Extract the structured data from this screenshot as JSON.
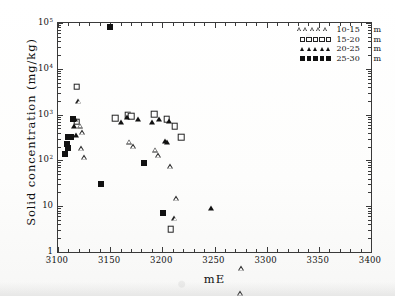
{
  "chart_data": {
    "type": "scatter",
    "title": "",
    "xlabel": "mE",
    "ylabel": "Solid concentration (mg/kg)",
    "xlim": [
      3100,
      3400
    ],
    "ylim": [
      1,
      100000
    ],
    "yscale": "log",
    "xscale": "linear",
    "grid": false,
    "legend_position": "top-right",
    "xticks": [
      3100,
      3150,
      3200,
      3250,
      3300,
      3350,
      3400
    ],
    "xticklabels": [
      "3100",
      "3150",
      "3200",
      "3250",
      "3300",
      "3350",
      "3400"
    ],
    "yticks": [
      1,
      10,
      100,
      1000,
      10000,
      100000
    ],
    "yticklabels": [
      "1",
      "10",
      "10<sup>2</sup>",
      "10<sup>3</sup>",
      "10<sup>4</sup>",
      "10<sup>5</sup>"
    ],
    "ytick_plain": [
      "1",
      "10",
      "100",
      "1000",
      "10000",
      "100000"
    ],
    "minor_ticks": true,
    "series": [
      {
        "name": "10-15",
        "label": "10-15",
        "unit": "m",
        "marker": "triangle-open",
        "color": "#222222",
        "points": [
          [
            3120,
            1950
          ],
          [
            3121,
            740
          ],
          [
            3123,
            690
          ],
          [
            3122,
            390
          ],
          [
            3125,
            320
          ],
          [
            3168,
            900
          ],
          [
            3172,
            920
          ],
          [
            3193,
            1000
          ],
          [
            3196,
            960
          ],
          [
            3208,
            730
          ],
          [
            3213,
            185
          ],
          [
            3212,
            88
          ],
          [
            3276,
            9.2
          ],
          [
            3275,
            3.3
          ]
        ]
      },
      {
        "name": "15-20",
        "label": "15-20",
        "unit": "m",
        "marker": "square-open",
        "color": "#222222",
        "points": [
          [
            3118,
            4100
          ],
          [
            3118,
            700
          ],
          [
            3155,
            830
          ],
          [
            3167,
            960
          ],
          [
            3170,
            930
          ],
          [
            3192,
            1030
          ],
          [
            3204,
            800
          ],
          [
            3212,
            560
          ],
          [
            3218,
            320
          ],
          [
            3208,
            3.1
          ]
        ]
      },
      {
        "name": "20-25",
        "label": "20-25",
        "unit": "m",
        "marker": "triangle-filled",
        "color": "#111111",
        "points": [
          [
            3116,
            790
          ],
          [
            3115,
            560
          ],
          [
            3117,
            350
          ],
          [
            3160,
            700
          ],
          [
            3166,
            880
          ],
          [
            3177,
            790
          ],
          [
            3190,
            700
          ],
          [
            3197,
            800
          ],
          [
            3206,
            730
          ],
          [
            3203,
            270
          ],
          [
            3204,
            250
          ],
          [
            3247,
            9.0
          ]
        ]
      },
      {
        "name": "25-30",
        "label": "25-30",
        "unit": "m",
        "marker": "square-filled",
        "color": "#111111",
        "points": [
          [
            3150,
            82000
          ],
          [
            3114,
            800
          ],
          [
            3110,
            330
          ],
          [
            3112,
            330
          ],
          [
            3109,
            225
          ],
          [
            3110,
            190
          ],
          [
            3107,
            135
          ],
          [
            3182,
            88
          ],
          [
            3141,
            31
          ],
          [
            3201,
            7.0
          ]
        ]
      }
    ]
  },
  "legend": {
    "entries": [
      {
        "range": "10-15",
        "unit": "m",
        "marker": "triangle-open",
        "repeat": 5
      },
      {
        "range": "15-20",
        "unit": "m",
        "marker": "square-open",
        "repeat": 5
      },
      {
        "range": "20-25",
        "unit": "m",
        "marker": "triangle-filled",
        "repeat": 5
      },
      {
        "range": "25-30",
        "unit": "m",
        "marker": "square-filled",
        "repeat": 5
      }
    ]
  },
  "axes": {
    "x_title": "mE",
    "y_title": "Solid concentration (mg/kg)"
  }
}
